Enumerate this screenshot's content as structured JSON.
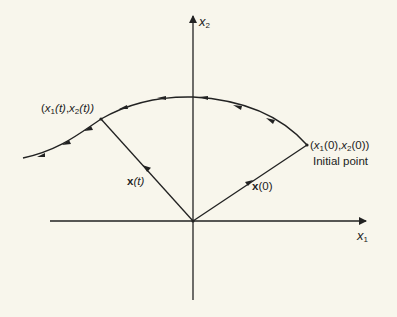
{
  "figure": {
    "type": "phase-plane trajectory",
    "axes": {
      "x_label": {
        "var": "x",
        "sub": "1"
      },
      "y_label": {
        "var": "x",
        "sub": "2"
      }
    },
    "points": {
      "current": {
        "text_open": "(",
        "v1": "x",
        "s1": "1",
        "arg1": "(t)",
        "comma": ",",
        "v2": "x",
        "s2": "2",
        "arg2": "(t))"
      },
      "initial": {
        "text_open": "(",
        "v1": "x",
        "s1": "1",
        "arg1": "(0)",
        "comma": ",",
        "v2": "x",
        "s2": "2",
        "arg2": "(0))"
      },
      "initial_caption": "Initial point"
    },
    "vectors": {
      "current": {
        "bold": "x",
        "arg": "(t)"
      },
      "initial": {
        "bold": "x",
        "arg": "(0)"
      }
    },
    "colors": {
      "background": "#f8f6ec",
      "ink": "#222222"
    }
  }
}
